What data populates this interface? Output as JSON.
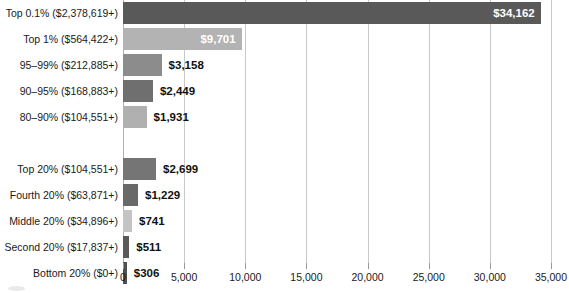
{
  "chart_data": {
    "type": "bar",
    "orientation": "horizontal",
    "title": "",
    "subtitle": "",
    "xlabel": "",
    "ylabel": "",
    "xlim": [
      0,
      35000
    ],
    "grid": true,
    "legend": null,
    "value_prefix": "$",
    "xtick_labels": [
      "0",
      "5,000",
      "10,000",
      "15,000",
      "20,000",
      "25,000",
      "30,000",
      "35,000"
    ],
    "xticks": [
      0,
      5000,
      10000,
      15000,
      20000,
      25000,
      30000,
      35000
    ],
    "groups": [
      {
        "name": "top-percentiles",
        "categories": [
          "Top 0.1% ($2,378,619+)",
          "Top 1% ($564,422+)",
          "95–99% ($212,885+)",
          "90–95% ($168,883+)",
          "80–90% ($104,551+)"
        ],
        "values": [
          34162,
          9701,
          3158,
          2449,
          1931
        ],
        "value_labels": [
          "$34,162",
          "$9,701",
          "$3,158",
          "$2,449",
          "$1,931"
        ],
        "colors": [
          "#595959",
          "#b3b3b3",
          "#8c8c8c",
          "#6f6f6f",
          "#b0b0b0"
        ],
        "label_inside": [
          true,
          true,
          false,
          false,
          false
        ]
      },
      {
        "name": "quintiles",
        "categories": [
          "Top 20% ($104,551+)",
          "Fourth 20% ($63,871+)",
          "Middle 20% ($34,896+)",
          "Second 20% ($17,837+)",
          "Bottom 20% ($0+)"
        ],
        "values": [
          2699,
          1229,
          741,
          511,
          306
        ],
        "value_labels": [
          "$2,699",
          "$1,229",
          "$741",
          "$511",
          "$306"
        ],
        "colors": [
          "#757575",
          "#696969",
          "#c4c4c4",
          "#595959",
          "#4f4f4f"
        ],
        "label_inside": [
          false,
          false,
          false,
          false,
          false
        ]
      }
    ],
    "colors_meta": {
      "gridline": "#c9c9c9",
      "axis": "#b0b0b0",
      "text": "#1a1a1a",
      "value_text": "#111111",
      "value_text_inside": "#ffffff",
      "background": "#ffffff"
    }
  }
}
